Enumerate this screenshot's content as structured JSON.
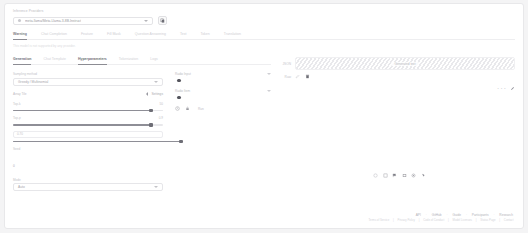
{
  "header": {
    "eyebrow": "Inference Providers",
    "model_value": "meta-llama/Meta-Llama-3-8B-Instruct",
    "model_icon": "dot-icon",
    "copy_button_icon": "copy-icon"
  },
  "task_tabs": [
    {
      "label": "Warning",
      "active": true
    },
    {
      "label": "Chat Completion",
      "active": false
    },
    {
      "label": "Feature",
      "active": false
    },
    {
      "label": "Fill Mask",
      "active": false
    },
    {
      "label": "Question Answering",
      "active": false
    },
    {
      "label": "Text",
      "active": false
    },
    {
      "label": "Token",
      "active": false
    },
    {
      "label": "Translation",
      "active": false
    }
  ],
  "hint": "This model is not supported by any provider.",
  "sub_tabs": [
    {
      "label": "Generation",
      "active": true
    },
    {
      "label": "Chat Template",
      "active": false
    },
    {
      "label": "Hyperparameters",
      "active": true
    },
    {
      "label": "Tokenization",
      "active": false
    },
    {
      "label": "Logs",
      "active": false
    }
  ],
  "form": {
    "sampling_label": "Sampling method",
    "sampling_value": "Greedy / Multinomial",
    "array_label": "Array Tile",
    "array_value": "Settings",
    "array_caret_icon": "chevron-left-icon",
    "sliders": [
      {
        "label": "Top-k",
        "value": "50",
        "fill_pct": 92
      },
      {
        "label": "Top-p",
        "value": "0.9",
        "fill_pct": 92
      },
      {
        "label": "Temperature",
        "value": "0.7",
        "fill_pct": 100,
        "textbox": "0.70"
      }
    ],
    "seed_label": "Seed",
    "seed_value": "0",
    "bottom_label": "Mode",
    "bottom_value": "Auto"
  },
  "radios": [
    {
      "label": "Radio Input",
      "caret_icon": "chevron-down-icon"
    },
    {
      "label": "Radio Item",
      "caret_icon": "chevron-down-icon"
    }
  ],
  "action_bar": {
    "icons": [
      "clock-icon",
      "lock-icon"
    ],
    "text": "Run"
  },
  "output": {
    "rows": [
      {
        "key": "JSON",
        "placeholder_label": "Generated text"
      },
      {
        "key": "Raw"
      }
    ],
    "action_icons": [
      "edit-icon",
      "trash-icon"
    ],
    "footer_dots": "• • •",
    "footer_icon": "pencil-icon"
  },
  "toolbar_icons": [
    "circle-icon",
    "square-icon",
    "flag-icon",
    "image-icon",
    "settings-icon",
    "cursor-icon"
  ],
  "footer": {
    "links": [
      "API",
      "GitHub",
      "Guide",
      "Participants",
      "Research"
    ],
    "separator": "·",
    "sub_links": [
      "Terms of Service",
      "Privacy Policy",
      "Code of Conduct",
      "Model Licenses",
      "Status Page",
      "Contact"
    ],
    "sub_separator": "|"
  }
}
